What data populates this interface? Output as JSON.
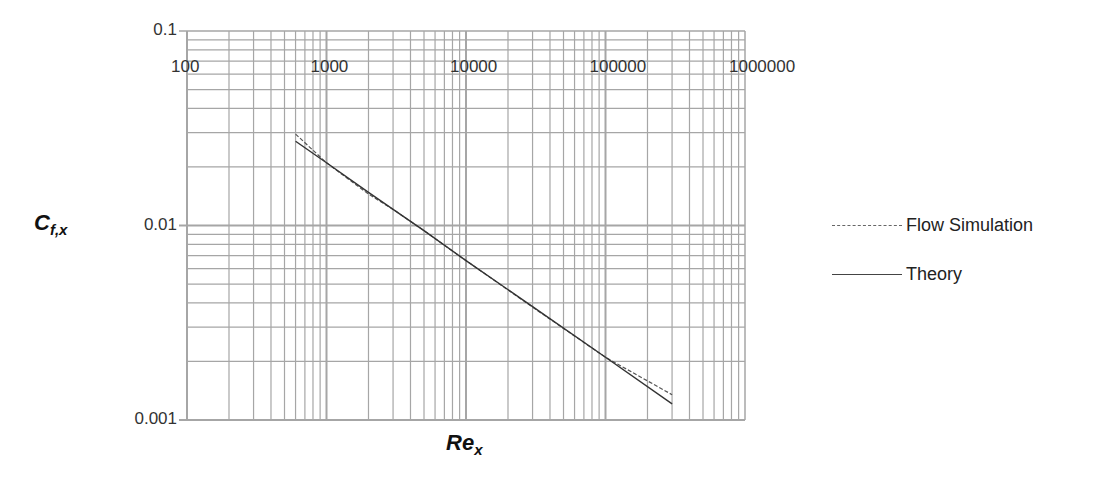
{
  "chart_data": {
    "type": "line",
    "title": "",
    "xlabel": "Re_x",
    "ylabel": "C_f,x",
    "xscale": "log",
    "yscale": "log",
    "xlim": [
      100,
      1000000
    ],
    "ylim": [
      0.001,
      0.1
    ],
    "x_tick_labels": [
      "100",
      "1000",
      "10000",
      "100000",
      "1000000"
    ],
    "y_tick_labels": [
      "0.1",
      "0.01",
      "0.001"
    ],
    "grid": true,
    "legend_position": "right",
    "series": [
      {
        "name": "Flow Simulation",
        "style": "dashed",
        "x": [
          600,
          1000,
          2000,
          3000,
          5000,
          10000,
          30000,
          100000,
          300000
        ],
        "y": [
          0.0295,
          0.021,
          0.0145,
          0.0121,
          0.0094,
          0.0066,
          0.0038,
          0.0021,
          0.00135
        ]
      },
      {
        "name": "Theory",
        "style": "solid",
        "x": [
          600,
          1000,
          2000,
          3000,
          5000,
          10000,
          30000,
          100000,
          300000
        ],
        "y": [
          0.0271,
          0.021,
          0.0148,
          0.0121,
          0.0094,
          0.0066,
          0.00383,
          0.0021,
          0.00121
        ]
      }
    ]
  },
  "axes": {
    "x_title_main": "Re",
    "x_title_sub": "x",
    "y_title_main": "C",
    "y_title_sub": "f,x"
  },
  "legend": {
    "items": [
      {
        "label": "Flow Simulation",
        "style": "dashed"
      },
      {
        "label": "Theory",
        "style": "solid"
      }
    ]
  },
  "colors": {
    "grid": "#a6a6a6",
    "series_sim": "#555555",
    "series_theory": "#333333"
  }
}
